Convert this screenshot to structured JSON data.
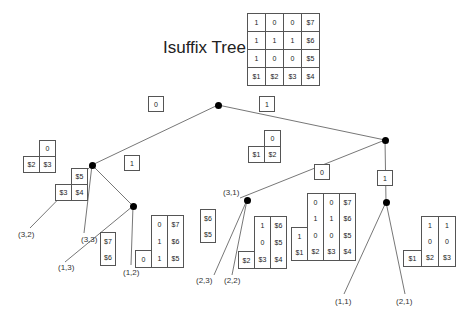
{
  "title": "Isuffix Tree of",
  "top_matrix": [
    [
      "1",
      "0",
      "0",
      "$7"
    ],
    [
      "1",
      "1",
      "1",
      "$6"
    ],
    [
      "1",
      "0",
      "0",
      "$5"
    ],
    [
      "$1",
      "$2",
      "$3",
      "$4"
    ]
  ],
  "edge_labels": {
    "root_left": "0",
    "root_right": "1",
    "left_mid": "1",
    "right_left": "0",
    "right_right": "1"
  },
  "leaves": {
    "l32": "(3,2)",
    "l33": "(3,3)",
    "l13": "(1,3)",
    "l12": "(1,2)",
    "l31": "(3,1)",
    "l23": "(2,3)",
    "l22": "(2,2)",
    "l11": "(1,1)",
    "l21": "(2,1)"
  },
  "boxes": {
    "b32": {
      "top": "0",
      "bl": "$2",
      "br": "$3"
    },
    "b33": {
      "top": "$5",
      "bl": "$3",
      "br": "$4"
    },
    "b13": [
      "$7",
      "$6"
    ],
    "b12": {
      "c2": [
        "0",
        "1",
        "1"
      ],
      "c3": [
        "$7",
        "$6",
        "$5"
      ],
      "c1": "0"
    },
    "b31": {
      "top": "0",
      "bl": "$1",
      "br": "$2"
    },
    "b23": [
      "$6",
      "$5"
    ],
    "b22": {
      "c2": [
        "1",
        "0",
        "$3"
      ],
      "c3": [
        "$6",
        "$5",
        "$4"
      ],
      "c1": "$2"
    },
    "b11": {
      "c1": [
        "1",
        "$1"
      ],
      "c2": [
        "0",
        "1",
        "0",
        "$2"
      ],
      "c3": [
        "0",
        "1",
        "0",
        "$3"
      ],
      "c4": [
        "$7",
        "$6",
        "$5",
        "$4"
      ]
    },
    "b21": {
      "c2": [
        "1",
        "0",
        "$2"
      ],
      "c3": [
        "1",
        "0",
        "$3"
      ],
      "c1": "$1"
    }
  }
}
